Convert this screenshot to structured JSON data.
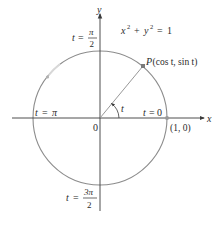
{
  "figure": {
    "equation": {
      "x": "x",
      "x_exp": "2",
      "plus": "+",
      "y": "y",
      "y_exp": "2",
      "equals": "=",
      "rhs": "1"
    },
    "axes": {
      "x_label": "x",
      "y_label": "y",
      "origin_label": "0"
    },
    "point_P": {
      "name": "P",
      "coords": "(cos t, sin t)"
    },
    "point_1_0": {
      "label": "(1, 0)"
    },
    "angle_label": "t",
    "labels": {
      "t0": {
        "var": "t",
        "eq": "=",
        "val": "0"
      },
      "t_pi": {
        "var": "t",
        "eq": "=",
        "val": "π"
      },
      "t_pi_over_2": {
        "var": "t",
        "eq": "=",
        "num": "π",
        "den": "2"
      },
      "t_3pi_over_2": {
        "var": "t",
        "eq": "=",
        "num": "3π",
        "den": "2"
      }
    },
    "colors": {
      "circle": "#8c8c8c",
      "axes": "#3a3a3a",
      "point": "#7a7a7a",
      "text": "#2b2b2b"
    }
  }
}
